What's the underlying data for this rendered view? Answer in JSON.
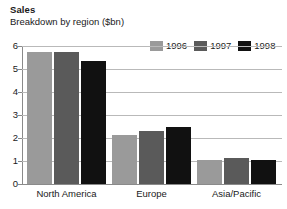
{
  "chart_data": {
    "type": "bar",
    "title": "Sales",
    "subtitle": "Breakdown by region ($bn)",
    "xlabel": "",
    "ylabel": "",
    "ylim": [
      0,
      6
    ],
    "yticks": [
      "0",
      "1",
      "2",
      "3",
      "4",
      "5",
      "6"
    ],
    "grid": true,
    "legend_position": "top-right",
    "categories": [
      "North America",
      "Europe",
      "Asia/Pacific"
    ],
    "series": [
      {
        "name": "1996",
        "color": "#9a9a9a",
        "values": [
          5.75,
          2.15,
          1.05
        ]
      },
      {
        "name": "1997",
        "color": "#5a5a5a",
        "values": [
          5.75,
          2.3,
          1.15
        ]
      },
      {
        "name": "1998",
        "color": "#111111",
        "values": [
          5.35,
          2.5,
          1.05
        ]
      }
    ]
  },
  "axis": {
    "tick_0": "0",
    "tick_1": "1",
    "tick_2": "2",
    "tick_3": "3",
    "tick_4": "4",
    "tick_5": "5",
    "tick_6": "6"
  },
  "legend": {
    "items": [
      {
        "label": "1996"
      },
      {
        "label": "1997"
      },
      {
        "label": "1998"
      }
    ]
  },
  "categories": {
    "c0": "North America",
    "c1": "Europe",
    "c2": "Asia/Pacific"
  },
  "colors": {
    "series_1996": "#9a9a9a",
    "series_1997": "#5a5a5a",
    "series_1998": "#111111",
    "gridline": "#b9b9b9",
    "axis": "#8a8a8a",
    "text": "#1a1a1a",
    "background": "#ffffff"
  }
}
